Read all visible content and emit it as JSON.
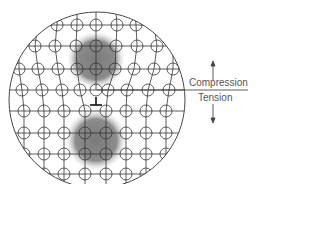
{
  "diagram": {
    "labels": {
      "compression": "Compression",
      "tension": "Tension"
    },
    "dislocation_symbol": "⊥",
    "colors": {
      "line": "#333333",
      "shade": "#808080",
      "text": "#555555"
    },
    "regions": [
      {
        "name": "compression-zone",
        "cx": 96,
        "cy": 60,
        "r": 30
      },
      {
        "name": "tension-zone",
        "cx": 96,
        "cy": 140,
        "r": 32
      }
    ],
    "outline_circle": {
      "cx": 97,
      "cy": 100,
      "r": 88
    },
    "rows": [
      {
        "y": 25,
        "xs": [
          57,
          77,
          96,
          117,
          136
        ]
      },
      {
        "y": 46,
        "xs": [
          35,
          55,
          76,
          96,
          116,
          137,
          157
        ]
      },
      {
        "y": 69,
        "xs": [
          19,
          38,
          58,
          77,
          96,
          115,
          134,
          154,
          173
        ]
      },
      {
        "y": 90,
        "xs": [
          22,
          42,
          62,
          80,
          96,
          108,
          127,
          148,
          169
        ]
      },
      {
        "y": 111,
        "xs": [
          24,
          44,
          64,
          85,
          106,
          126,
          146,
          166
        ]
      },
      {
        "y": 133,
        "xs": [
          24,
          44,
          64,
          85,
          106,
          126,
          146,
          166
        ]
      },
      {
        "y": 154,
        "xs": [
          24,
          44,
          64,
          85,
          106,
          126,
          146,
          166
        ]
      },
      {
        "y": 174,
        "xs": [
          44,
          64,
          85,
          106,
          126,
          146
        ]
      }
    ]
  }
}
